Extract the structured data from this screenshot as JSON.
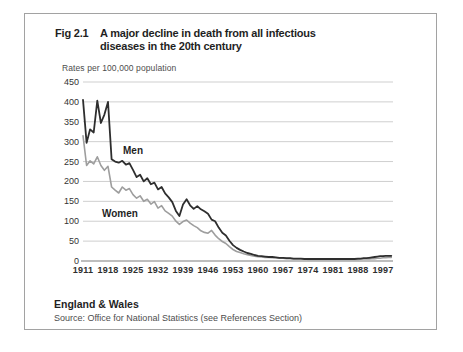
{
  "figure": {
    "number": "Fig 2.1",
    "title_line1": "A major decline in death from all infectious",
    "title_line2": "diseases in the 20th century",
    "region": "England & Wales",
    "source": "Source: Office for National Statistics (see References Section)"
  },
  "colors": {
    "men_line": "#2e2e2e",
    "women_line": "#9e9e9e",
    "gridline": "#cfcfcf",
    "axis_line": "#7d7d7d",
    "frame_border": "#a2a2a2",
    "text": "#1f1f1f",
    "muted_text": "#4d4d4d",
    "background": "#ffffff"
  },
  "chart_data": {
    "type": "line",
    "title": "A major decline in death from all infectious diseases in the 20th century",
    "xlabel": "",
    "ylabel": "Rates per 100,000 population",
    "ylim": [
      0,
      450
    ],
    "grid": "horizontal",
    "legend": "inline-labels",
    "y_ticks": [
      0,
      50,
      100,
      150,
      200,
      250,
      300,
      350,
      400,
      450
    ],
    "x_tick_labels": [
      "1911",
      "1918",
      "1925",
      "1932",
      "1939",
      "1946",
      "1953",
      "1960",
      "1967",
      "1974",
      "1981",
      "1988",
      "1997"
    ],
    "x_tick_years": [
      1911,
      1918,
      1925,
      1932,
      1939,
      1946,
      1953,
      1960,
      1967,
      1974,
      1981,
      1988,
      1997
    ],
    "x": [
      1911,
      1912,
      1913,
      1914,
      1915,
      1916,
      1917,
      1918,
      1919,
      1920,
      1921,
      1922,
      1923,
      1924,
      1925,
      1926,
      1927,
      1928,
      1929,
      1930,
      1931,
      1932,
      1933,
      1934,
      1935,
      1936,
      1937,
      1938,
      1939,
      1940,
      1941,
      1942,
      1943,
      1944,
      1945,
      1946,
      1947,
      1948,
      1949,
      1950,
      1951,
      1952,
      1953,
      1954,
      1955,
      1956,
      1957,
      1958,
      1959,
      1960,
      1961,
      1962,
      1963,
      1964,
      1965,
      1966,
      1967,
      1968,
      1969,
      1970,
      1971,
      1972,
      1973,
      1974,
      1975,
      1976,
      1977,
      1978,
      1979,
      1980,
      1981,
      1982,
      1983,
      1984,
      1985,
      1986,
      1987,
      1988,
      1989,
      1990,
      1991,
      1992,
      1993,
      1994,
      1995,
      1996,
      1997,
      1998,
      1999,
      2000
    ],
    "series": [
      {
        "name": "Men",
        "color": "#2e2e2e",
        "values": [
          405,
          297,
          331,
          323,
          403,
          347,
          368,
          400,
          256,
          250,
          247,
          252,
          242,
          246,
          229,
          211,
          217,
          200,
          208,
          193,
          197,
          180,
          186,
          170,
          160,
          148,
          126,
          113,
          142,
          155,
          140,
          131,
          138,
          130,
          125,
          119,
          104,
          100,
          84,
          71,
          64,
          51,
          40,
          33,
          28,
          24,
          20,
          18,
          15,
          13,
          12,
          11,
          10,
          10,
          9,
          8,
          8,
          7,
          7,
          6,
          6,
          6,
          5,
          5,
          5,
          5,
          5,
          5,
          5,
          5,
          5,
          5,
          5,
          5,
          5,
          5,
          5,
          6,
          6,
          7,
          7,
          8,
          9,
          10,
          11,
          12,
          12,
          13,
          13,
          13
        ]
      },
      {
        "name": "Women",
        "color": "#9e9e9e",
        "values": [
          315,
          240,
          252,
          244,
          262,
          240,
          228,
          238,
          186,
          178,
          171,
          186,
          178,
          182,
          167,
          158,
          164,
          150,
          155,
          143,
          149,
          133,
          139,
          126,
          120,
          113,
          100,
          92,
          99,
          103,
          95,
          89,
          84,
          76,
          72,
          70,
          77,
          65,
          56,
          49,
          44,
          36,
          29,
          24,
          21,
          18,
          16,
          14,
          12,
          11,
          10,
          9,
          9,
          8,
          8,
          7,
          7,
          6,
          6,
          5,
          5,
          5,
          5,
          4,
          4,
          4,
          4,
          4,
          4,
          4,
          4,
          4,
          4,
          4,
          4,
          4,
          4,
          4,
          5,
          5,
          5,
          5,
          6,
          6,
          7,
          7,
          8,
          8,
          9,
          9
        ]
      }
    ]
  }
}
